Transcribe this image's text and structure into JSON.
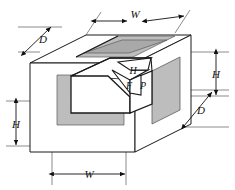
{
  "figure": {
    "colors": {
      "background": "#ffffff",
      "outline": "#1a1a1a",
      "thin_line": "#5a5a5a",
      "shade_gray": "#bdbdbd",
      "shade_gray_dark": "#a9a9a9",
      "shade_gray_light": "#d2d2d2",
      "label_color": "#111111"
    },
    "dimensions": [
      {
        "id": "w-top",
        "label": "W",
        "orientation": "isometric-right",
        "position": "top",
        "x": 135,
        "y": 14
      },
      {
        "id": "d-left",
        "label": "D",
        "orientation": "isometric-left",
        "position": "upper-left",
        "x": 43,
        "y": 39
      },
      {
        "id": "h-right",
        "label": "H",
        "orientation": "vertical",
        "position": "right",
        "x": 216,
        "y": 74
      },
      {
        "id": "d-right",
        "label": "D",
        "orientation": "isometric-left",
        "position": "lower-right",
        "x": 201,
        "y": 110
      },
      {
        "id": "h-left",
        "label": "H",
        "orientation": "vertical",
        "position": "left",
        "x": 16,
        "y": 124
      },
      {
        "id": "w-bottom",
        "label": "W",
        "orientation": "horizontal",
        "position": "bottom",
        "x": 89,
        "y": 174
      }
    ],
    "face_labels": [
      {
        "id": "label-h",
        "label": "H",
        "x": 133,
        "y": 74,
        "face": "recess-top-step"
      },
      {
        "id": "label-f",
        "label": "F",
        "x": 129,
        "y": 87,
        "face": "recess-chamfer"
      },
      {
        "id": "label-p",
        "label": "P",
        "x": 143,
        "y": 87,
        "face": "recess-right"
      }
    ]
  }
}
